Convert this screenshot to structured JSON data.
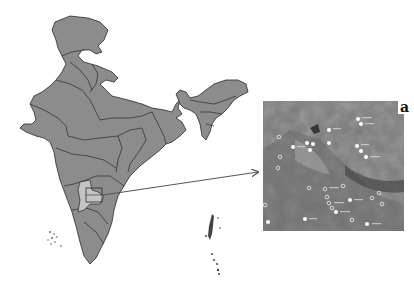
{
  "figure": {
    "panel_label": "a",
    "map_region": "India",
    "highlighted_area": "study area (southern India)",
    "inset_type": "satellite image with sampling points",
    "colors": {
      "land": "#8c8c8c",
      "border": "#2a2a2a",
      "highlight": "#c4c4c4",
      "arrow": "#555555",
      "inset_base": "#777777"
    },
    "inset_points": {
      "filled": 18,
      "hollow": 16
    }
  }
}
